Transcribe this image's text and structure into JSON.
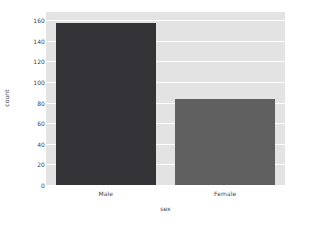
{
  "chart_data": {
    "type": "bar",
    "title": "",
    "subtitle": "",
    "xlabel": "sex",
    "ylabel": "count",
    "categories": [
      "Male",
      "Female"
    ],
    "values": [
      157,
      84
    ],
    "series": [
      {
        "name": "count",
        "values": [
          157,
          84
        ]
      }
    ],
    "ylim": [
      0,
      168
    ],
    "yticks": [
      0,
      20,
      40,
      60,
      80,
      100,
      120,
      140,
      160
    ],
    "ytick_labels": [
      "0",
      "20",
      "40",
      "60",
      "80",
      "100",
      "120",
      "140",
      "160"
    ],
    "xtick_labels": [
      "Male",
      "Female"
    ],
    "grid": true,
    "grid_axis": "y",
    "legend": false,
    "legend_position": "none",
    "bar_colors": [
      "#333338",
      "#606060"
    ],
    "plot_background": "#e3e3e3",
    "figure_background": "#ffffff",
    "grid_color": "#ffffff",
    "tick_label_color": "#444444",
    "axis_label_color": "#3a3a3a"
  }
}
